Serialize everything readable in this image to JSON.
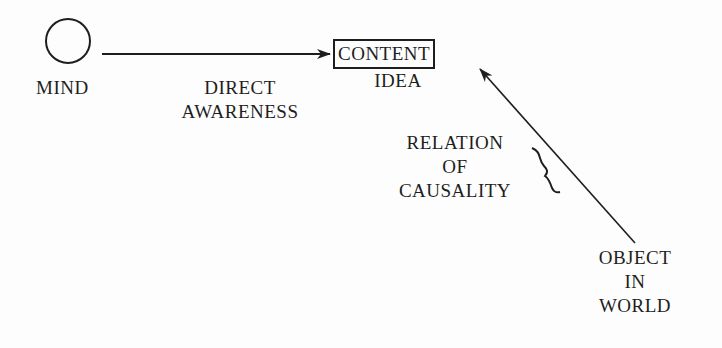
{
  "diagram": {
    "nodes": {
      "mind": {
        "label": "MIND",
        "shape": "circle"
      },
      "content": {
        "box_label": "CONTENT",
        "sub_label": "IDEA",
        "shape": "box"
      },
      "object": {
        "lines": [
          "OBJECT",
          "IN",
          "WORLD"
        ]
      }
    },
    "edges": {
      "direct": {
        "lines": [
          "DIRECT",
          "AWARENESS"
        ],
        "from": "mind",
        "to": "content"
      },
      "causal": {
        "lines": [
          "RELATION",
          "OF",
          "CAUSALITY"
        ],
        "from": "object",
        "to": "content",
        "marker": "brace"
      }
    },
    "colors": {
      "ink": "#1e1e1e",
      "background": "#fdfdfd"
    }
  }
}
